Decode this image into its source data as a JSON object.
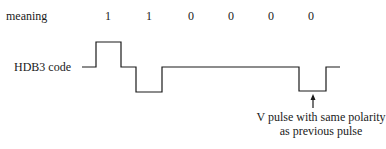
{
  "labels": {
    "meaning": "meaning",
    "code": "HDB3 code"
  },
  "meaning_bits": [
    {
      "value": "1",
      "x": 108
    },
    {
      "value": "1",
      "x": 149
    },
    {
      "value": "0",
      "x": 191
    },
    {
      "value": "0",
      "x": 231
    },
    {
      "value": "0",
      "x": 271
    },
    {
      "value": "0",
      "x": 311
    }
  ],
  "annotation": {
    "line1": "V pulse with same polarity",
    "line2": "as previous pulse"
  },
  "waveform": {
    "points": "82,67 96,67 96,42 121,42 121,67 136,67 136,92 162,92 162,67 299,67 299,91 326,91 326,67 340,67",
    "stroke": "#1a1a1a"
  }
}
